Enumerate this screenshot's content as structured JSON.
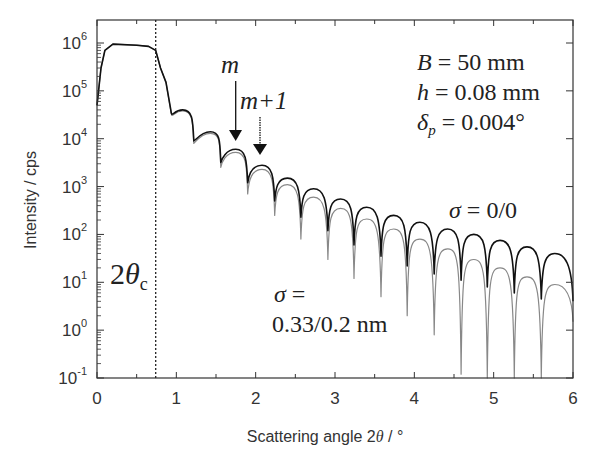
{
  "chart_data": {
    "type": "line",
    "title": "",
    "xlabel": "Scattering angle 2θ / °",
    "ylabel": "Intensity / cps",
    "xlim": [
      0,
      6
    ],
    "ylim": [
      0.1,
      1000000
    ],
    "yscale": "log",
    "x_ticks": [
      "0",
      "1",
      "2",
      "3",
      "4",
      "5",
      "6"
    ],
    "y_ticks": [
      {
        "base": "10",
        "exp": "-1"
      },
      {
        "base": "10",
        "exp": "0"
      },
      {
        "base": "10",
        "exp": "1"
      },
      {
        "base": "10",
        "exp": "2"
      },
      {
        "base": "10",
        "exp": "3"
      },
      {
        "base": "10",
        "exp": "4"
      },
      {
        "base": "10",
        "exp": "5"
      },
      {
        "base": "10",
        "exp": "6"
      }
    ],
    "grid": false,
    "critical_angle": {
      "x": 0.74,
      "label": "2θc"
    },
    "series": [
      {
        "name": "σ = 0/0",
        "color": "#111111",
        "peaks": [
          [
            0.87,
            150000
          ],
          [
            1.08,
            40000
          ],
          [
            1.43,
            14000
          ],
          [
            1.75,
            6000
          ],
          [
            2.08,
            2800
          ],
          [
            2.4,
            1500
          ],
          [
            2.73,
            900
          ],
          [
            3.07,
            550
          ],
          [
            3.4,
            370
          ],
          [
            3.74,
            250
          ],
          [
            4.07,
            180
          ],
          [
            4.42,
            130
          ],
          [
            4.75,
            100
          ],
          [
            5.08,
            75
          ],
          [
            5.42,
            55
          ],
          [
            5.77,
            40
          ]
        ],
        "minima": [
          [
            0.93,
            40000
          ],
          [
            1.22,
            9000
          ],
          [
            1.56,
            3200
          ],
          [
            1.9,
            1200
          ],
          [
            2.24,
            500
          ],
          [
            2.57,
            230
          ],
          [
            2.91,
            120
          ],
          [
            3.24,
            60
          ],
          [
            3.58,
            35
          ],
          [
            3.91,
            22
          ],
          [
            4.25,
            15
          ],
          [
            4.59,
            11
          ],
          [
            4.92,
            8
          ],
          [
            5.26,
            6
          ],
          [
            5.6,
            4.5
          ],
          [
            6.0,
            4
          ]
        ]
      },
      {
        "name": "σ = 0.33/0.2 nm",
        "color": "#888888",
        "peaks": [
          [
            0.87,
            150000
          ],
          [
            1.08,
            38000
          ],
          [
            1.43,
            13000
          ],
          [
            1.75,
            5200
          ],
          [
            2.08,
            2300
          ],
          [
            2.4,
            1100
          ],
          [
            2.73,
            600
          ],
          [
            3.07,
            350
          ],
          [
            3.4,
            210
          ],
          [
            3.74,
            130
          ],
          [
            4.07,
            80
          ],
          [
            4.42,
            50
          ],
          [
            4.75,
            30
          ],
          [
            5.08,
            20
          ],
          [
            5.42,
            13
          ],
          [
            5.77,
            9
          ]
        ],
        "minima": [
          [
            0.93,
            38000
          ],
          [
            1.22,
            8000
          ],
          [
            1.56,
            2500
          ],
          [
            1.9,
            700
          ],
          [
            2.24,
            250
          ],
          [
            2.57,
            80
          ],
          [
            2.91,
            30
          ],
          [
            3.24,
            12
          ],
          [
            3.58,
            5
          ],
          [
            3.91,
            2
          ],
          [
            4.25,
            0.8
          ],
          [
            4.59,
            0.12
          ],
          [
            4.92,
            0.1
          ],
          [
            5.26,
            0.1
          ],
          [
            5.6,
            0.1
          ],
          [
            6.0,
            1.5
          ]
        ]
      }
    ],
    "plateau": [
      [
        0,
        50000
      ],
      [
        0.05,
        300000
      ],
      [
        0.1,
        700000
      ],
      [
        0.2,
        950000
      ],
      [
        0.5,
        900000
      ],
      [
        0.65,
        850000
      ],
      [
        0.74,
        700000
      ],
      [
        0.8,
        300000
      ],
      [
        0.87,
        150000
      ]
    ],
    "annotations": [
      {
        "text": "m",
        "x": 1.75,
        "arrow_to": 6000
      },
      {
        "text": "m+1",
        "x": 2.08,
        "arrow_to": 2800
      },
      {
        "text": "σ = 0/0"
      },
      {
        "text": "σ = 0.33/0.2 nm"
      }
    ],
    "parameters": [
      "B = 50 mm",
      "h = 0.08 mm",
      "δp = 0.004°"
    ]
  },
  "labels": {
    "xlabel_text": "Scattering angle 2",
    "xlabel_theta": "θ",
    "xlabel_unit": " / °",
    "ylabel": "Intensity  / cps",
    "two_theta_c_num": "2",
    "two_theta_c_theta": "θ",
    "two_theta_c_sub": "c",
    "m": "m",
    "m_plus_1": "m+1",
    "param_B_sym": "B",
    "param_B_val": " = 50 mm",
    "param_h_sym": "h",
    "param_h_val": " = 0.08 mm",
    "param_d_sym": "δ",
    "param_d_sub": "p",
    "param_d_val": " = 0.004°",
    "sigma_sym": "σ",
    "sigma_zero_val": " = 0/0",
    "sigma_rough_eq": " =",
    "sigma_rough_val": "0.33/0.2 nm"
  }
}
